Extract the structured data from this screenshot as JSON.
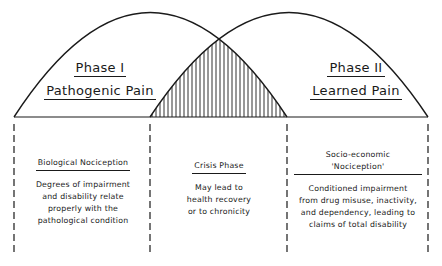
{
  "phases": [
    {
      "name": "Phase I",
      "subtitle": "Pathogenic Pain"
    },
    {
      "name": "Phase II",
      "subtitle": "Learned Pain"
    }
  ],
  "overlap": {
    "pattern": "vertical-hatch",
    "meaning": "Crisis Phase"
  },
  "columns": [
    {
      "heading": "Biological Nociception",
      "body": [
        "Degrees of impairment",
        "and disability relate",
        "properly with the",
        "pathological condition"
      ]
    },
    {
      "heading": "Crisis Phase",
      "body": [
        "May lead to",
        "health recovery",
        "or to chronicity"
      ]
    },
    {
      "heading_lines": [
        "Socio-economic",
        "'Nociception'"
      ],
      "body": [
        "Conditioned impairment",
        "from drug misuse, inactivity,",
        "and dependency, leading to",
        "claims of total disability"
      ]
    }
  ],
  "colors": {
    "ink": "#1a1a1a",
    "background": "#ffffff"
  }
}
